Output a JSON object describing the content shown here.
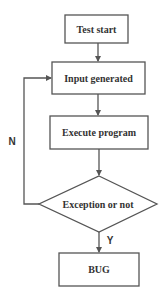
{
  "diagram": {
    "type": "flowchart",
    "nodes": [
      {
        "id": "start",
        "shape": "rectangle",
        "label": "Test start"
      },
      {
        "id": "input",
        "shape": "rectangle",
        "label": "Input generated"
      },
      {
        "id": "execute",
        "shape": "rectangle",
        "label": "Execute program"
      },
      {
        "id": "decision",
        "shape": "diamond",
        "label": "Exception or not"
      },
      {
        "id": "bug",
        "shape": "rectangle",
        "label": "BUG"
      }
    ],
    "edges": [
      {
        "from": "start",
        "to": "input",
        "label": ""
      },
      {
        "from": "input",
        "to": "execute",
        "label": ""
      },
      {
        "from": "execute",
        "to": "decision",
        "label": ""
      },
      {
        "from": "decision",
        "to": "bug",
        "label": "Y"
      },
      {
        "from": "decision",
        "to": "input",
        "label": "N"
      }
    ],
    "edge_labels": {
      "no": "N",
      "yes": "Y"
    },
    "colors": {
      "stroke": "#555555",
      "text": "#333333",
      "background": "#ffffff"
    }
  }
}
